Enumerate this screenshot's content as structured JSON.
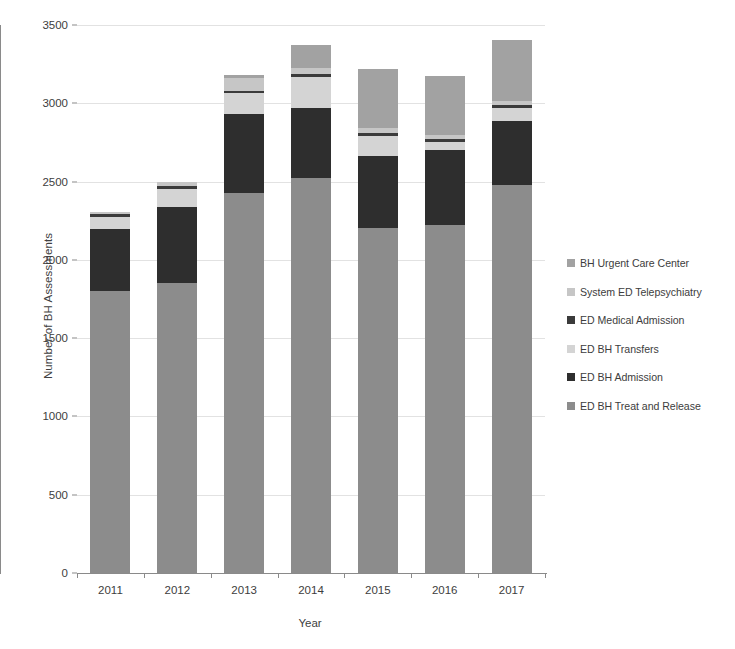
{
  "chart_data": {
    "type": "bar",
    "subtype": "stacked",
    "title": "",
    "xlabel": "Year",
    "ylabel": "Number of BH Assessments",
    "categories": [
      "2011",
      "2012",
      "2013",
      "2014",
      "2015",
      "2016",
      "2017"
    ],
    "ylim": [
      0,
      3500
    ],
    "yticks": [
      0,
      500,
      1000,
      1500,
      2000,
      2500,
      3000,
      3500
    ],
    "grid": true,
    "legend_position": "right",
    "series": [
      {
        "name": "ED BH Treat and Release",
        "color": "#8c8c8c",
        "values": [
          1800,
          1855,
          2425,
          2520,
          2205,
          2225,
          2480
        ]
      },
      {
        "name": "ED BH Admission",
        "color": "#2e2e2e",
        "values": [
          400,
          480,
          505,
          450,
          460,
          475,
          410
        ]
      },
      {
        "name": "ED BH Transfers",
        "color": "#d4d4d4",
        "values": [
          75,
          120,
          135,
          200,
          125,
          55,
          80
        ]
      },
      {
        "name": "ED Medical Admission",
        "color": "#3b3b3b",
        "values": [
          20,
          15,
          15,
          20,
          20,
          20,
          20
        ]
      },
      {
        "name": "System ED Telepsychiatry",
        "color": "#c6c6c6",
        "values": [
          10,
          30,
          85,
          35,
          30,
          25,
          25
        ]
      },
      {
        "name": "BH Urgent Care Center",
        "color": "#a2a2a2",
        "values": [
          0,
          0,
          15,
          150,
          380,
          375,
          390
        ]
      }
    ],
    "totals": [
      2305,
      2500,
      3180,
      3375,
      3220,
      3175,
      3405
    ]
  },
  "legend": {
    "items": [
      {
        "label": "BH Urgent Care Center",
        "color": "#a2a2a2"
      },
      {
        "label": "System ED Telepsychiatry",
        "color": "#c6c6c6"
      },
      {
        "label": "ED Medical Admission",
        "color": "#3b3b3b"
      },
      {
        "label": "ED BH Transfers",
        "color": "#d4d4d4"
      },
      {
        "label": "ED BH Admission",
        "color": "#2e2e2e"
      },
      {
        "label": "ED BH Treat and Release",
        "color": "#8c8c8c"
      }
    ]
  }
}
